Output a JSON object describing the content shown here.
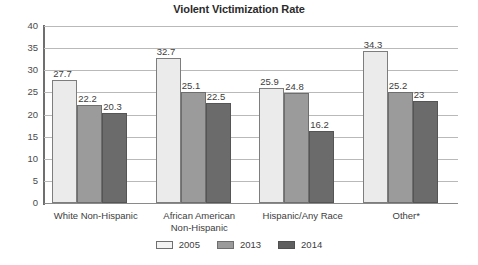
{
  "chart_data": {
    "type": "bar",
    "title": "Violent Victimization Rate",
    "xlabel": "",
    "ylabel": "",
    "ylim": [
      0,
      40
    ],
    "yticks": [
      0,
      5,
      10,
      15,
      20,
      25,
      30,
      35,
      40
    ],
    "grid": true,
    "legend_position": "bottom",
    "categories": [
      "White Non-Hispanic",
      "African American Non-Hispanic",
      "Hispanic/Any Race",
      "Other*"
    ],
    "category_lines": [
      [
        "White Non-Hispanic"
      ],
      [
        "African American",
        "Non-Hispanic"
      ],
      [
        "Hispanic/Any Race"
      ],
      [
        "Other*"
      ]
    ],
    "series": [
      {
        "name": "2005",
        "color": "#ebebeb",
        "values": [
          27.7,
          32.7,
          25.9,
          34.3
        ],
        "labels": [
          "27.7",
          "32.7",
          "25.9",
          "34.3"
        ]
      },
      {
        "name": "2013",
        "color": "#9b9b9b",
        "values": [
          22.2,
          25.1,
          24.8,
          25.2
        ],
        "labels": [
          "22.2",
          "25.1",
          "24.8",
          "25.2"
        ]
      },
      {
        "name": "2014",
        "color": "#6b6b6b",
        "values": [
          20.3,
          22.5,
          16.2,
          23
        ],
        "labels": [
          "20.3",
          "22.5",
          "16.2",
          "23"
        ]
      }
    ]
  }
}
